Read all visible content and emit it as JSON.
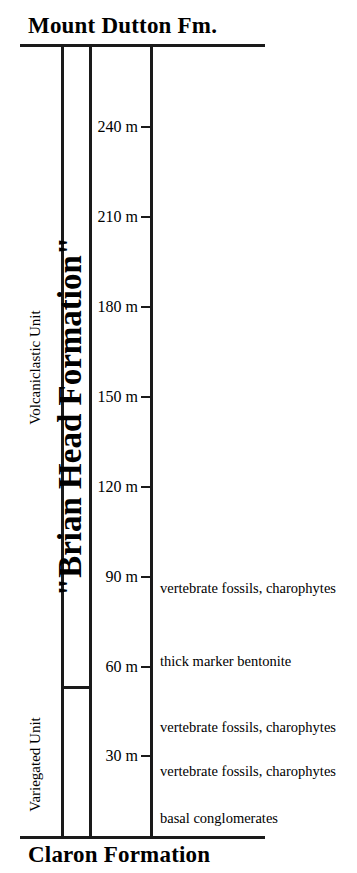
{
  "figure": {
    "type": "stratigraphic-column",
    "width": 357,
    "height": 873,
    "background_color": "#ffffff",
    "line_color": "#1a1a1a"
  },
  "boundaries": {
    "top_formation": "Mount Dutton Fm.",
    "bottom_formation": "Claron Formation"
  },
  "formation": {
    "label": "\"Brian Head Formation\""
  },
  "members": [
    {
      "name": "volcaniclastic",
      "label": "Volcaniclastic Unit"
    },
    {
      "name": "variegated",
      "label": "Variegated Unit"
    }
  ],
  "scale": {
    "unit": "m",
    "ticks": [
      {
        "label": "240 m",
        "value": 240,
        "y": 127
      },
      {
        "label": "210 m",
        "value": 210,
        "y": 217
      },
      {
        "label": "180 m",
        "value": 180,
        "y": 307
      },
      {
        "label": "150 m",
        "value": 150,
        "y": 397
      },
      {
        "label": "120 m",
        "value": 120,
        "y": 487
      },
      {
        "label": "90 m",
        "value": 90,
        "y": 577
      },
      {
        "label": "60 m",
        "value": 60,
        "y": 667
      },
      {
        "label": "30 m",
        "value": 30,
        "y": 756
      }
    ]
  },
  "annotations": [
    {
      "text": "vertebrate fossils, charophytes",
      "y": 588
    },
    {
      "text": "thick marker bentonite",
      "y": 661
    },
    {
      "text": "vertebrate fossils, charophytes",
      "y": 727
    },
    {
      "text": "vertebrate fossils, charophytes",
      "y": 771
    },
    {
      "text": "basal conglomerates",
      "y": 818
    }
  ],
  "chart_data": {
    "type": "table",
    "ylabel": "Thickness (m)",
    "ylim": [
      0,
      250
    ],
    "categories": [
      "240 m",
      "210 m",
      "180 m",
      "150 m",
      "120 m",
      "90 m",
      "60 m",
      "30 m"
    ],
    "values": [
      240,
      210,
      180,
      150,
      120,
      90,
      60,
      30
    ],
    "grid": false,
    "legend": "none",
    "bounding_formations": {
      "above": "Mount Dutton Fm.",
      "below": "Claron Formation"
    },
    "units": [
      {
        "name": "Volcaniclastic Unit",
        "approx_range_m": [
          53,
          264
        ]
      },
      {
        "name": "Variegated Unit",
        "approx_range_m": [
          0,
          53
        ]
      }
    ],
    "annotated_horizons": [
      {
        "label": "vertebrate fossils, charophytes",
        "approx_level_m": 86
      },
      {
        "label": "thick marker bentonite",
        "approx_level_m": 61
      },
      {
        "label": "vertebrate fossils, charophytes",
        "approx_level_m": 39
      },
      {
        "label": "vertebrate fossils, charophytes",
        "approx_level_m": 25
      },
      {
        "label": "basal conglomerates",
        "approx_level_m": 9
      }
    ]
  }
}
